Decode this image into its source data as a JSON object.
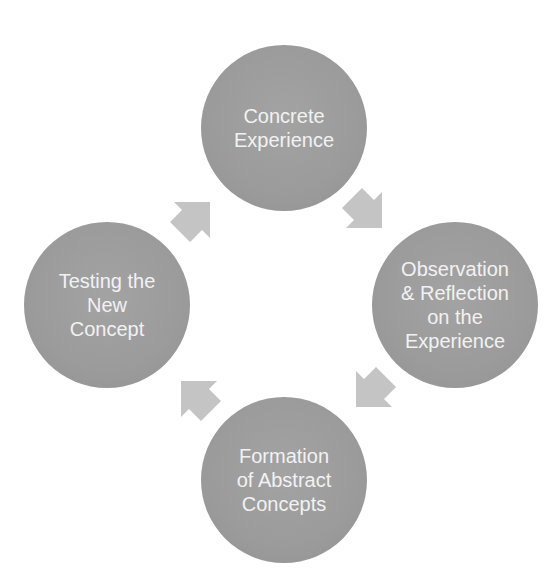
{
  "diagram": {
    "title": "",
    "type": "cycle",
    "colors": {
      "node_fill": "#9c9c9c",
      "node_text": "#f2f2f2",
      "arrow_fill": "#c4c4c4",
      "background": "#ffffff"
    },
    "nodes": [
      {
        "id": "concrete-experience",
        "label": "Concrete\nExperience",
        "position": "top"
      },
      {
        "id": "observation-reflection",
        "label": "Observation\n& Reflection\non the\nExperience",
        "position": "right"
      },
      {
        "id": "formation-abstract",
        "label": "Formation\nof Abstract\nConcepts",
        "position": "bottom"
      },
      {
        "id": "testing-new-concept",
        "label": "Testing the\nNew\nConcept",
        "position": "left"
      }
    ],
    "edges": [
      {
        "from": "concrete-experience",
        "to": "observation-reflection",
        "direction": "down-right"
      },
      {
        "from": "observation-reflection",
        "to": "formation-abstract",
        "direction": "down-left"
      },
      {
        "from": "formation-abstract",
        "to": "testing-new-concept",
        "direction": "up-left"
      },
      {
        "from": "testing-new-concept",
        "to": "concrete-experience",
        "direction": "up-right"
      }
    ]
  }
}
